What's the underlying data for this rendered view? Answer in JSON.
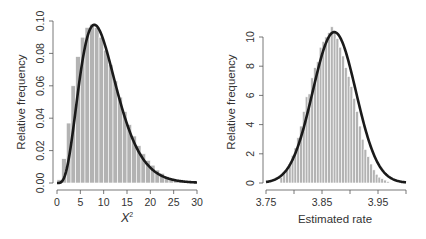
{
  "chart_data": [
    {
      "type": "bar",
      "subtype": "histogram-with-density-curve",
      "title": "",
      "xlabel": "X²",
      "xlabel_base": "X",
      "xlabel_sup": "2",
      "ylabel": "Relative frequency",
      "xlim": [
        0,
        30
      ],
      "ylim": [
        0,
        0.1
      ],
      "x_ticks": [
        0,
        5,
        10,
        15,
        20,
        25,
        30
      ],
      "x_tick_labels": [
        "0",
        "5",
        "10",
        "15",
        "20",
        "25",
        "30"
      ],
      "y_ticks": [
        0,
        0.02,
        0.04,
        0.06,
        0.08,
        0.1
      ],
      "y_tick_labels": [
        "0.00",
        "0.02",
        "0.04",
        "0.06",
        "0.08",
        "0.10"
      ],
      "grid": false,
      "legend": null,
      "histogram": {
        "bin_width": 1,
        "bin_starts": [
          0,
          1,
          2,
          3,
          4,
          5,
          6,
          7,
          8,
          9,
          10,
          11,
          12,
          13,
          14,
          15,
          16,
          17,
          18,
          19,
          20,
          21,
          22,
          23,
          24,
          25,
          26,
          27,
          28,
          29
        ],
        "values": [
          0.002,
          0.015,
          0.037,
          0.06,
          0.078,
          0.09,
          0.096,
          0.098,
          0.096,
          0.09,
          0.082,
          0.073,
          0.063,
          0.053,
          0.044,
          0.036,
          0.029,
          0.023,
          0.018,
          0.014,
          0.011,
          0.008,
          0.006,
          0.004,
          0.003,
          0.002,
          0.002,
          0.001,
          0.001,
          0.001
        ],
        "bar_color": "#b3b3b3",
        "edge_color": "#ffffff"
      },
      "curve": {
        "label": "chi-squared density, df = 10",
        "df": 10,
        "peak_x": 8,
        "peak_y": 0.0975,
        "color": "#1a1a1a"
      }
    },
    {
      "type": "bar",
      "subtype": "histogram-with-density-curve",
      "title": "",
      "xlabel": "Estimated rate",
      "ylabel": "Relative frequency",
      "xlim": [
        3.75,
        4.0
      ],
      "ylim": [
        0,
        10
      ],
      "x_ticks": [
        3.75,
        3.8,
        3.85,
        3.9,
        3.95,
        4.0
      ],
      "x_tick_labels": [
        "3.75",
        "",
        "3.85",
        "",
        "3.95",
        ""
      ],
      "y_ticks": [
        0,
        2,
        4,
        6,
        8,
        10
      ],
      "y_tick_labels": [
        "0",
        "2",
        "4",
        "6",
        "8",
        "10"
      ],
      "grid": false,
      "legend": null,
      "histogram": {
        "bin_width": 0.005,
        "bin_starts": [
          3.775,
          3.78,
          3.785,
          3.79,
          3.795,
          3.8,
          3.805,
          3.81,
          3.815,
          3.82,
          3.825,
          3.83,
          3.835,
          3.84,
          3.845,
          3.85,
          3.855,
          3.86,
          3.865,
          3.87,
          3.875,
          3.88,
          3.885,
          3.89,
          3.895,
          3.9,
          3.905,
          3.91,
          3.915,
          3.92,
          3.925,
          3.93,
          3.935,
          3.94,
          3.945,
          3.95,
          3.955,
          3.96,
          3.965
        ],
        "values": [
          0.4,
          0.6,
          0.9,
          1.3,
          1.9,
          2.4,
          3.1,
          3.9,
          4.9,
          5.9,
          6.1,
          7.2,
          7.9,
          8.3,
          9.3,
          9.7,
          10.0,
          10.3,
          10.7,
          10.3,
          9.9,
          9.3,
          8.7,
          7.9,
          7.3,
          6.6,
          5.8,
          4.9,
          3.9,
          3.0,
          2.3,
          1.8,
          1.3,
          0.9,
          0.6,
          0.4,
          0.3,
          0.2,
          0.1
        ],
        "bar_color": "#b3b3b3",
        "edge_color": "#ffffff"
      },
      "curve": {
        "label": "normal density",
        "mean": 3.872,
        "sd": 0.0386,
        "peak_y": 10.35,
        "color": "#1a1a1a"
      }
    }
  ],
  "panels": [
    {
      "ylabel": "Relative frequency",
      "xlabel_base": "X",
      "xlabel_sup": "2",
      "x_tick_labels": [
        "0",
        "5",
        "10",
        "15",
        "20",
        "25",
        "30"
      ],
      "y_tick_labels": [
        "0.00",
        "0.02",
        "0.04",
        "0.06",
        "0.08",
        "0.10"
      ]
    },
    {
      "ylabel": "Relative frequency",
      "xlabel": "Estimated rate",
      "x_tick_labels": [
        "3.75",
        "3.85",
        "3.95"
      ],
      "y_tick_labels": [
        "0",
        "2",
        "4",
        "6",
        "8",
        "10"
      ]
    }
  ],
  "colors": {
    "bars": "#b3b3b3",
    "bar_edges": "#ffffff",
    "curve": "#1a1a1a",
    "axis": "#555555",
    "text": "#333333",
    "background": "#ffffff"
  }
}
